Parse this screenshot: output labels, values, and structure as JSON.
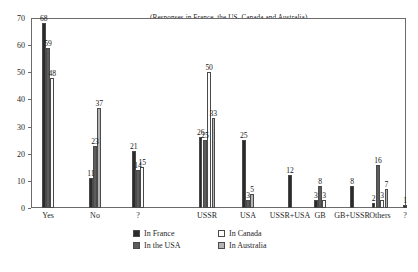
{
  "chart_data": {
    "type": "bar",
    "title": "(Responses in France, the US, Canada and Australia)",
    "xlabel": "",
    "ylabel": "",
    "ylim": [
      0,
      70
    ],
    "ytick_values": [
      0,
      10,
      20,
      30,
      40,
      50,
      60,
      70
    ],
    "ytick_labels": [
      "0",
      "10",
      "20",
      "30",
      "40",
      "50",
      "60",
      "70"
    ],
    "grid": false,
    "legend_position": "bottom-center",
    "categories": [
      "Yes",
      "No",
      "?",
      "USSR",
      "USA",
      "USSR+USA",
      "GB",
      "GB+USSR",
      "Others",
      "?"
    ],
    "series": [
      {
        "name": "In France",
        "color": "#2b2b2b",
        "values": [
          68,
          11,
          21,
          26,
          25,
          12,
          3,
          8,
          2,
          1
        ]
      },
      {
        "name": "In the USA",
        "color": "#5c5c5c",
        "values": [
          59,
          23,
          14,
          25,
          3,
          0,
          8,
          0,
          16,
          0
        ]
      },
      {
        "name": "In Canada",
        "color": "#fbfbfb",
        "values": [
          48,
          0,
          15,
          50,
          0,
          0,
          3,
          0,
          3,
          0
        ]
      },
      {
        "name": "In Australia",
        "color": "#b4b4b4",
        "values": [
          0,
          37,
          0,
          33,
          5,
          0,
          0,
          0,
          7,
          0
        ]
      }
    ],
    "point_labels": [
      {
        "text": "68",
        "category": "Yes",
        "series": "In France",
        "value": 68
      },
      {
        "text": "59",
        "category": "Yes",
        "series": "In the USA",
        "value": 59
      },
      {
        "text": "48",
        "category": "Yes",
        "series": "In Canada",
        "value": 48
      },
      {
        "text": "11",
        "category": "No",
        "series": "In France",
        "value": 11
      },
      {
        "text": "23",
        "category": "No",
        "series": "In the USA",
        "value": 23
      },
      {
        "text": "37",
        "category": "No",
        "series": "In Australia",
        "value": 37
      },
      {
        "text": "21",
        "category": "?",
        "series": "In France",
        "value": 21
      },
      {
        "text": "14",
        "category": "?",
        "series": "In the USA",
        "value": 14
      },
      {
        "text": "15",
        "category": "?",
        "series": "In Canada",
        "value": 15
      },
      {
        "text": "26",
        "category": "USSR",
        "series": "In France",
        "value": 26
      },
      {
        "text": "25",
        "category": "USSR",
        "series": "In the USA",
        "value": 25
      },
      {
        "text": "50",
        "category": "USSR",
        "series": "In Canada",
        "value": 50
      },
      {
        "text": "33",
        "category": "USSR",
        "series": "In Australia",
        "value": 33
      },
      {
        "text": "25",
        "category": "USA",
        "series": "In France",
        "value": 25
      },
      {
        "text": "3",
        "category": "USA",
        "series": "In the USA",
        "value": 3
      },
      {
        "text": "5",
        "category": "USA",
        "series": "In Australia",
        "value": 5
      },
      {
        "text": "12",
        "category": "USSR+USA",
        "series": "In France",
        "value": 12
      },
      {
        "text": "3",
        "category": "GB",
        "series": "In France",
        "value": 3
      },
      {
        "text": "8",
        "category": "GB",
        "series": "In the USA",
        "value": 8
      },
      {
        "text": "3",
        "category": "GB",
        "series": "In Canada",
        "value": 3
      },
      {
        "text": "8",
        "category": "GB+USSR",
        "series": "In France",
        "value": 8
      },
      {
        "text": "2",
        "category": "Others",
        "series": "In France",
        "value": 2
      },
      {
        "text": "16",
        "category": "Others",
        "series": "In the USA",
        "value": 16
      },
      {
        "text": "7",
        "category": "Others",
        "series": "In Australia",
        "value": 7
      },
      {
        "text": "1",
        "category": "?",
        "series": "In France",
        "value": 1
      }
    ]
  },
  "legend": {
    "entries": [
      {
        "label": "In France"
      },
      {
        "label": "In the USA"
      },
      {
        "label": "In Canada"
      },
      {
        "label": "In Australia"
      }
    ]
  }
}
